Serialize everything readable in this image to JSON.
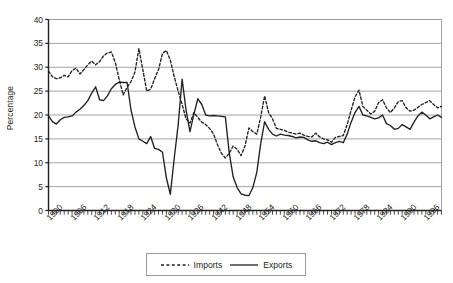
{
  "chart_data": {
    "type": "line",
    "title": "",
    "subtitle": "",
    "xlabel": "",
    "ylabel": "Percentage",
    "ylim": [
      0,
      40
    ],
    "ytick_step": 5,
    "yticks": [
      0,
      5,
      10,
      15,
      20,
      25,
      30,
      35,
      40
    ],
    "xlim": [
      1900,
      2000
    ],
    "xtick_labels": [
      "1900",
      "1906",
      "1912",
      "1918",
      "1924",
      "1930",
      "1936",
      "1942",
      "1948",
      "1954",
      "1960",
      "1966",
      "1972",
      "1978",
      "1984",
      "1990",
      "1996"
    ],
    "xtick_step_years": 6,
    "minor_xticks": "annual",
    "grid": "horizontal",
    "legend_position": "bottom-center",
    "x": [
      1900,
      1901,
      1902,
      1903,
      1904,
      1905,
      1906,
      1907,
      1908,
      1909,
      1910,
      1911,
      1912,
      1913,
      1914,
      1915,
      1916,
      1917,
      1918,
      1919,
      1920,
      1921,
      1922,
      1923,
      1924,
      1925,
      1926,
      1927,
      1928,
      1929,
      1930,
      1931,
      1932,
      1933,
      1934,
      1935,
      1936,
      1937,
      1938,
      1939,
      1940,
      1941,
      1942,
      1943,
      1944,
      1945,
      1946,
      1947,
      1948,
      1949,
      1950,
      1951,
      1952,
      1953,
      1954,
      1955,
      1956,
      1957,
      1958,
      1959,
      1960,
      1961,
      1962,
      1963,
      1964,
      1965,
      1966,
      1967,
      1968,
      1969,
      1970,
      1971,
      1972,
      1973,
      1974,
      1975,
      1976,
      1977,
      1978,
      1979,
      1980,
      1981,
      1982,
      1983,
      1984,
      1985,
      1986,
      1987,
      1988,
      1989,
      1990,
      1991,
      1992,
      1993,
      1994,
      1995,
      1996,
      1997,
      1998,
      1999,
      2000
    ],
    "series": [
      {
        "name": "Imports",
        "style": "dashed",
        "color": "#231f20",
        "values": [
          29.2,
          28.0,
          27.6,
          27.8,
          28.3,
          28.0,
          29.3,
          29.8,
          28.6,
          29.5,
          30.5,
          31.3,
          30.5,
          31.2,
          32.4,
          33.0,
          33.2,
          31.0,
          27.4,
          24.2,
          25.8,
          27.0,
          29.0,
          33.9,
          29.5,
          25.0,
          25.4,
          27.6,
          29.5,
          32.9,
          33.5,
          31.5,
          28.0,
          25.0,
          22.2,
          19.2,
          18.3,
          20.5,
          19.5,
          18.5,
          18.0,
          17.2,
          16.0,
          13.8,
          12.0,
          11.0,
          12.0,
          13.5,
          12.8,
          11.5,
          13.5,
          17.3,
          16.5,
          16.0,
          19.6,
          24.0,
          20.5,
          19.2,
          17.2,
          17.0,
          16.8,
          16.4,
          16.2,
          16.0,
          16.2,
          15.8,
          15.5,
          15.4,
          16.2,
          15.4,
          15.0,
          14.8,
          14.3,
          15.3,
          15.5,
          15.7,
          18.0,
          21.0,
          23.8,
          25.2,
          21.8,
          21.0,
          20.2,
          20.8,
          22.6,
          23.2,
          21.5,
          20.5,
          21.5,
          22.8,
          23.0,
          21.5,
          20.8,
          21.0,
          21.6,
          22.2,
          22.6,
          23.0,
          22.2,
          21.5,
          21.8
        ]
      },
      {
        "name": "Exports",
        "style": "solid",
        "color": "#231f20",
        "values": [
          19.8,
          18.6,
          18.1,
          19.0,
          19.5,
          19.6,
          19.8,
          20.6,
          21.2,
          22.0,
          23.0,
          24.6,
          25.9,
          23.2,
          23.0,
          24.0,
          25.5,
          26.4,
          26.9,
          26.8,
          26.8,
          21.0,
          17.5,
          15.0,
          14.5,
          14.0,
          15.5,
          13.0,
          12.8,
          12.2,
          6.8,
          3.4,
          11.0,
          18.0,
          27.5,
          21.0,
          16.5,
          20.2,
          23.4,
          22.2,
          20.0,
          19.8,
          19.9,
          19.8,
          19.7,
          19.6,
          12.0,
          7.0,
          4.8,
          3.5,
          3.2,
          3.1,
          4.8,
          8.0,
          14.0,
          18.6,
          17.0,
          16.0,
          15.6,
          16.0,
          15.8,
          15.7,
          15.5,
          15.2,
          15.4,
          15.3,
          14.8,
          14.5,
          14.6,
          14.2,
          14.0,
          14.3,
          13.8,
          14.2,
          14.5,
          14.2,
          16.0,
          18.5,
          20.5,
          21.8,
          20.0,
          19.8,
          19.5,
          19.2,
          19.4,
          20.0,
          18.2,
          17.8,
          17.0,
          17.2,
          18.0,
          17.5,
          17.0,
          18.5,
          19.8,
          20.6,
          20.0,
          19.2,
          19.6,
          20.0,
          19.5
        ]
      }
    ]
  },
  "legend": {
    "items": [
      {
        "label": "Imports",
        "style": "dashed"
      },
      {
        "label": "Exports",
        "style": "solid"
      }
    ]
  },
  "axis": {
    "ylabel": "Percentage"
  },
  "colors": {
    "ink": "#231f20",
    "grid": "#9a9a9a",
    "frame": "#8c8c8c",
    "background": "#ffffff"
  }
}
